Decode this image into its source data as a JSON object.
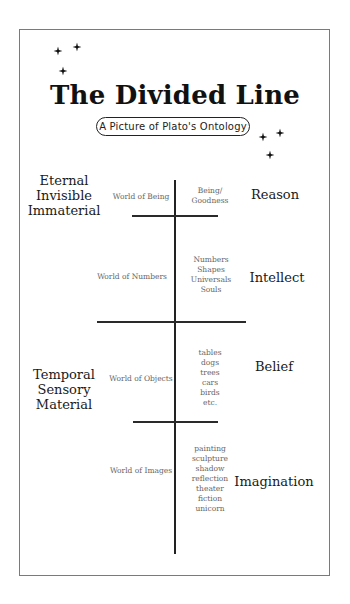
{
  "title": "The Divided Line",
  "subtitle": "A Picture of Plato's Ontology",
  "decorations": {
    "stars": [
      {
        "name": "star-icon",
        "x": 58,
        "y": 51
      },
      {
        "name": "star-icon",
        "x": 77,
        "y": 47
      },
      {
        "name": "star-icon",
        "x": 63,
        "y": 71
      },
      {
        "name": "star-icon",
        "x": 263,
        "y": 137
      },
      {
        "name": "star-icon",
        "x": 280,
        "y": 133
      },
      {
        "name": "star-icon",
        "x": 270,
        "y": 155
      }
    ]
  },
  "realms": {
    "upper": {
      "lines": [
        "Eternal",
        "Invisible",
        "Immaterial"
      ]
    },
    "lower": {
      "lines": [
        "Temporal",
        "Sensory",
        "Material"
      ]
    }
  },
  "segments": [
    {
      "world": "World of Being",
      "examples": [
        "Being/",
        "Goodness"
      ],
      "faculty": "Reason"
    },
    {
      "world": "World of Numbers",
      "examples": [
        "Numbers",
        "Shapes",
        "Universals",
        "Souls"
      ],
      "faculty": "Intellect"
    },
    {
      "world": "World of Objects",
      "examples": [
        "tables",
        "dogs",
        "trees",
        "cars",
        "birds",
        "etc."
      ],
      "faculty": "Belief"
    },
    {
      "world": "World of Images",
      "examples": [
        "painting",
        "sculpture",
        "shadow",
        "reflection",
        "theater",
        "fiction",
        "unicorn"
      ],
      "faculty": "Imagination"
    }
  ]
}
